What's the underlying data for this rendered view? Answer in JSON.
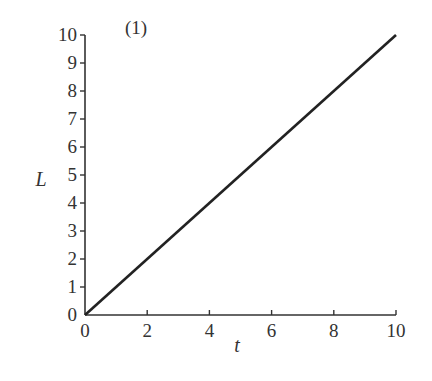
{
  "chart_data": {
    "type": "line",
    "title": "(1)",
    "xlabel": "t",
    "ylabel": "L",
    "xlim": [
      0,
      10
    ],
    "ylim": [
      0,
      10
    ],
    "xticks": [
      0,
      2,
      4,
      6,
      8,
      10
    ],
    "yticks": [
      0,
      1,
      2,
      3,
      4,
      5,
      6,
      7,
      8,
      9,
      10
    ],
    "grid": false,
    "legend": null,
    "series": [
      {
        "name": "L(t)",
        "x": [
          0,
          10
        ],
        "y": [
          0,
          10
        ],
        "color": "#222222"
      }
    ]
  }
}
